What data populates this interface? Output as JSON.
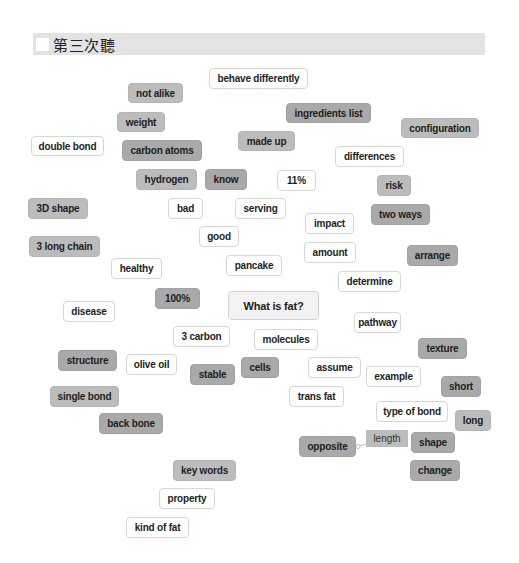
{
  "header": {
    "title": "第三次聽",
    "checkbox_checked": false
  },
  "colors": {
    "header_bg": "#e3e3e3",
    "tag_white": "#ffffff",
    "tag_gray": "#bcbcbc",
    "tag_dark": "#a9a9a9",
    "center_tag": "#f3f3f3"
  },
  "center": {
    "label": "What is fat?"
  },
  "tags": [
    {
      "label": "behave differently",
      "style": "white"
    },
    {
      "label": "not alike",
      "style": "gray"
    },
    {
      "label": "ingredients list",
      "style": "dark"
    },
    {
      "label": "weight",
      "style": "gray"
    },
    {
      "label": "configuration",
      "style": "gray"
    },
    {
      "label": "double bond",
      "style": "white"
    },
    {
      "label": "made up",
      "style": "gray"
    },
    {
      "label": "carbon atoms",
      "style": "dark"
    },
    {
      "label": "differences",
      "style": "white"
    },
    {
      "label": "hydrogen",
      "style": "gray"
    },
    {
      "label": "know",
      "style": "dark"
    },
    {
      "label": "11%",
      "style": "white"
    },
    {
      "label": "risk",
      "style": "gray"
    },
    {
      "label": "3D shape",
      "style": "gray"
    },
    {
      "label": "bad",
      "style": "white"
    },
    {
      "label": "serving",
      "style": "white"
    },
    {
      "label": "two ways",
      "style": "dark"
    },
    {
      "label": "impact",
      "style": "white"
    },
    {
      "label": "good",
      "style": "white"
    },
    {
      "label": "3 long chain",
      "style": "gray"
    },
    {
      "label": "amount",
      "style": "white"
    },
    {
      "label": "arrange",
      "style": "dark"
    },
    {
      "label": "healthy",
      "style": "white"
    },
    {
      "label": "pancake",
      "style": "white"
    },
    {
      "label": "determine",
      "style": "white"
    },
    {
      "label": "100%",
      "style": "dark"
    },
    {
      "label": "disease",
      "style": "white"
    },
    {
      "label": "pathway",
      "style": "white"
    },
    {
      "label": "3 carbon",
      "style": "white"
    },
    {
      "label": "molecules",
      "style": "white"
    },
    {
      "label": "texture",
      "style": "dark"
    },
    {
      "label": "structure",
      "style": "dark"
    },
    {
      "label": "olive oil",
      "style": "white"
    },
    {
      "label": "stable",
      "style": "dark"
    },
    {
      "label": "cells",
      "style": "dark"
    },
    {
      "label": "assume",
      "style": "white"
    },
    {
      "label": "example",
      "style": "white"
    },
    {
      "label": "short",
      "style": "dark"
    },
    {
      "label": "single bond",
      "style": "gray"
    },
    {
      "label": "trans fat",
      "style": "white"
    },
    {
      "label": "type of bond",
      "style": "white"
    },
    {
      "label": "long",
      "style": "gray"
    },
    {
      "label": "back bone",
      "style": "dark"
    },
    {
      "label": "shape",
      "style": "dark"
    },
    {
      "label": "opposite",
      "style": "dark"
    },
    {
      "label": "key words",
      "style": "gray"
    },
    {
      "label": "change",
      "style": "dark"
    },
    {
      "label": "property",
      "style": "white"
    },
    {
      "label": "kind of fat",
      "style": "white"
    }
  ],
  "connector_label": {
    "label": "length",
    "from": "opposite"
  }
}
